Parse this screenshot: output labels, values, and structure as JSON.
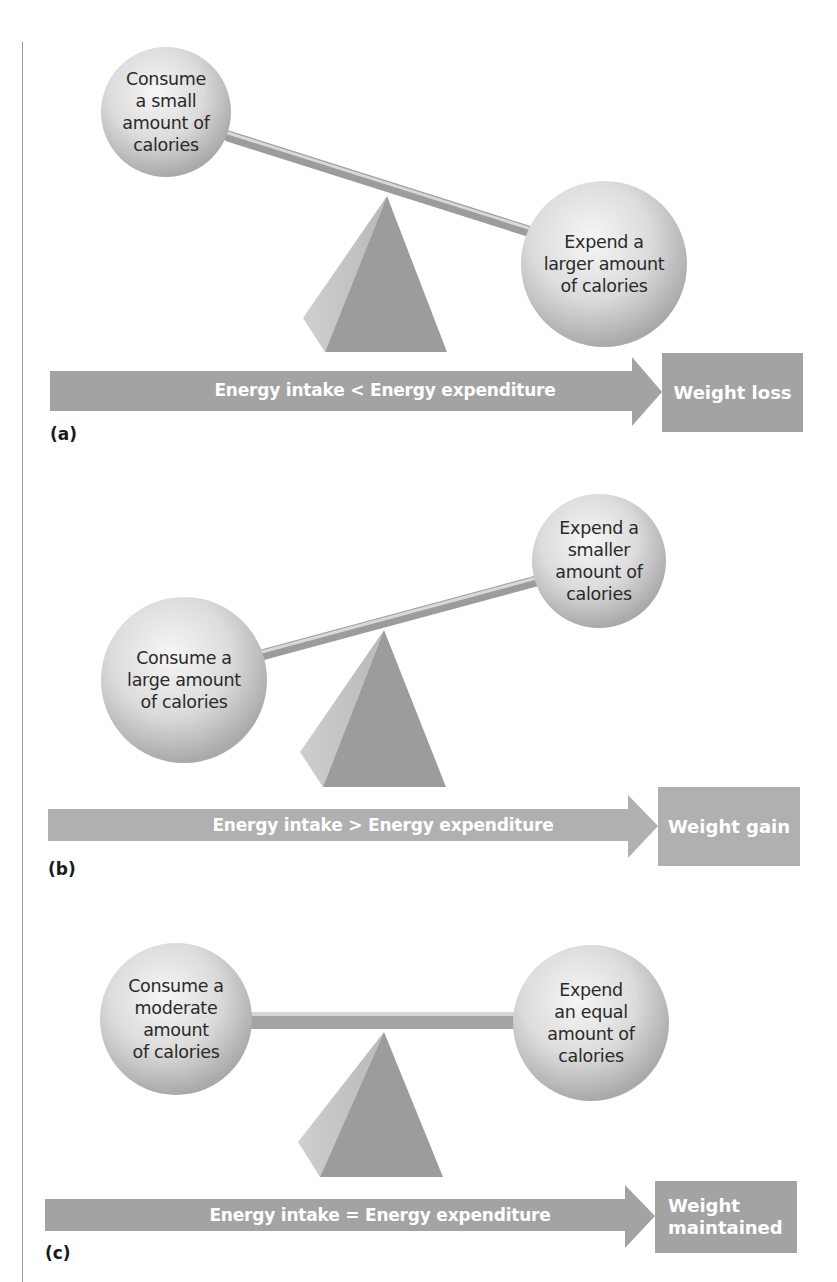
{
  "colors": {
    "arrow_fill": "#a3a3a3",
    "box_fill": "#a3a3a3",
    "pyramid_front": "#9b9b9b",
    "pyramid_side": "#c4c4c4",
    "beam": "#a8a8a8",
    "ball_light": "#f4f4f4",
    "ball_dark": "#b5b5b5",
    "text_dark": "#2a2a2a",
    "text_light": "#ffffff"
  },
  "panels": [
    {
      "label": "(a)",
      "left_ball": {
        "lines": [
          "Consume",
          "a small",
          "amount of",
          "calories"
        ]
      },
      "right_ball": {
        "lines": [
          "Expend a",
          "larger amount",
          "of calories"
        ]
      },
      "arrow_text": "Energy intake < Energy expenditure",
      "result_lines": [
        "Weight loss"
      ],
      "balance_state": "tilted-right-down"
    },
    {
      "label": "(b)",
      "left_ball": {
        "lines": [
          "Consume a",
          "large amount",
          "of calories"
        ]
      },
      "right_ball": {
        "lines": [
          "Expend a",
          "smaller",
          "amount of",
          "calories"
        ]
      },
      "arrow_text": "Energy intake > Energy expenditure",
      "result_lines": [
        "Weight gain"
      ],
      "balance_state": "tilted-left-down"
    },
    {
      "label": "(c)",
      "left_ball": {
        "lines": [
          "Consume a",
          "moderate",
          "amount",
          "of calories"
        ]
      },
      "right_ball": {
        "lines": [
          "Expend",
          "an equal",
          "amount of",
          "calories"
        ]
      },
      "arrow_text": "Energy intake = Energy expenditure",
      "result_lines": [
        "Weight",
        "maintained"
      ],
      "balance_state": "level"
    }
  ]
}
